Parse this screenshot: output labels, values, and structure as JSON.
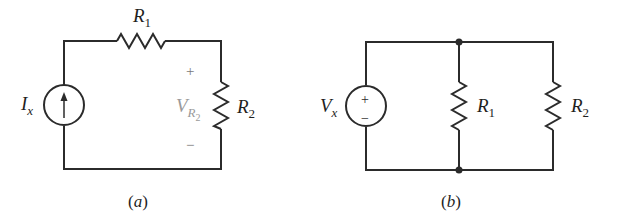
{
  "figure": {
    "circuit_a": {
      "caption_open": "(",
      "caption_letter": "a",
      "caption_close": ")",
      "source": {
        "type": "current-source",
        "label_main": "I",
        "label_sub": "x",
        "arrow": "up"
      },
      "resistor_1": {
        "label_main": "R",
        "label_sub": "1",
        "orientation": "horizontal",
        "position": "top"
      },
      "resistor_2": {
        "label_main": "R",
        "label_sub": "2",
        "orientation": "vertical",
        "position": "right"
      },
      "voltage_label": {
        "label_main": "V",
        "label_sub": "R",
        "label_subsub": "2",
        "plus": "+",
        "minus": "−"
      },
      "topology": "series"
    },
    "circuit_b": {
      "caption_open": "(",
      "caption_letter": "b",
      "caption_close": ")",
      "source": {
        "type": "voltage-source",
        "label_main": "V",
        "label_sub": "x",
        "plus": "+",
        "minus": "−"
      },
      "resistor_1": {
        "label_main": "R",
        "label_sub": "1",
        "orientation": "vertical",
        "position": "middle"
      },
      "resistor_2": {
        "label_main": "R",
        "label_sub": "2",
        "orientation": "vertical",
        "position": "right"
      },
      "topology": "parallel",
      "nodes": 2
    },
    "colors": {
      "wire": "#2b2b2b",
      "text": "#1f1f1f",
      "voltage_label": "#9a9a9a"
    }
  }
}
